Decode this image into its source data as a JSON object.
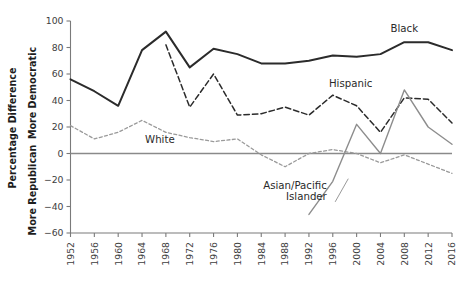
{
  "chart_data": {
    "type": "line",
    "title": "",
    "xlabel": "",
    "ylabel": "Percentage Difference",
    "ylabel_upper": "More Democratic",
    "ylabel_lower": "More Republican",
    "ylim": [
      -60,
      100
    ],
    "yticks": [
      100,
      80,
      60,
      40,
      20,
      0,
      -20,
      -40,
      -60
    ],
    "ytick_labels": [
      "100",
      "80",
      "60",
      "40",
      "20",
      "0",
      "−20",
      "−40",
      "−60"
    ],
    "grid": false,
    "legend": "inline-labels",
    "zero_reference_line": true,
    "categories": [
      1952,
      1956,
      1960,
      1964,
      1968,
      1972,
      1976,
      1980,
      1984,
      1988,
      1992,
      1996,
      2000,
      2004,
      2008,
      2012,
      2016
    ],
    "xtick_labels": [
      "1952",
      "1956",
      "1960",
      "1964",
      "1968",
      "1972",
      "1976",
      "1980",
      "1984",
      "1988",
      "1992",
      "1996",
      "2000",
      "2004",
      "2008",
      "2012",
      "2016"
    ],
    "series": [
      {
        "name": "Black",
        "label": "Black",
        "style": "solid",
        "color": "#2b2b2b",
        "width": 2.0,
        "x": [
          1952,
          1956,
          1960,
          1964,
          1968,
          1972,
          1976,
          1980,
          1984,
          1988,
          1992,
          1996,
          2000,
          2004,
          2008,
          2012,
          2016
        ],
        "values": [
          56,
          47,
          36,
          78,
          92,
          65,
          79,
          75,
          68,
          68,
          70,
          74,
          73,
          75,
          84,
          84,
          78
        ]
      },
      {
        "name": "Hispanic",
        "label": "Hispanic",
        "style": "dashed",
        "color": "#2b2b2b",
        "width": 1.5,
        "x": [
          1968,
          1972,
          1976,
          1980,
          1984,
          1988,
          1992,
          1996,
          2000,
          2004,
          2008,
          2012,
          2016
        ],
        "values": [
          82,
          35,
          60,
          29,
          30,
          35,
          29,
          44,
          36,
          16,
          42,
          41,
          23
        ]
      },
      {
        "name": "White",
        "label": "White",
        "style": "dotted",
        "color": "#9a9a9a",
        "width": 1.3,
        "x": [
          1952,
          1956,
          1960,
          1964,
          1968,
          1972,
          1976,
          1980,
          1984,
          1988,
          1992,
          1996,
          2000,
          2004,
          2008,
          2012,
          2016
        ],
        "values": [
          21,
          11,
          16,
          25,
          16,
          12,
          9,
          11,
          -1,
          -10,
          0,
          3,
          0,
          -7,
          -1,
          -8,
          -15
        ]
      },
      {
        "name": "Asian/Pacific Islander",
        "label": "Asian/Pacific\nIslander",
        "style": "solid",
        "color": "#8d8d8d",
        "width": 1.4,
        "x": [
          1992,
          1996,
          2000,
          2004,
          2008,
          2012,
          2016
        ],
        "values": [
          -46,
          -21,
          22,
          0,
          48,
          20,
          7
        ]
      }
    ],
    "annotations": [
      {
        "text": "Black",
        "x": 2008,
        "y": 92
      },
      {
        "text": "Hispanic",
        "x": 1999,
        "y": 50
      },
      {
        "text": "White",
        "x": 1967,
        "y": 8
      },
      {
        "text": "Asian/Pacific",
        "x": 1995,
        "y": -27
      },
      {
        "text": "Islander",
        "x": 1995,
        "y": -35
      }
    ]
  }
}
